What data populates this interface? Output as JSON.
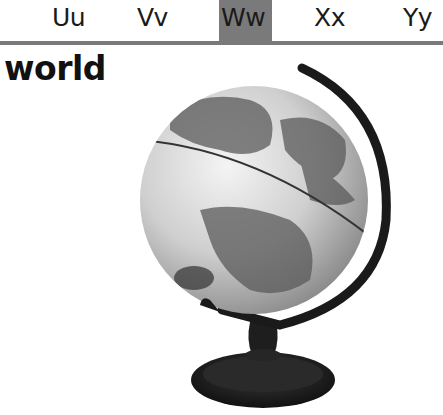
{
  "alphabet_strip": {
    "letters": [
      {
        "label": "Uu",
        "x": 52
      },
      {
        "label": "Vv",
        "x": 137
      },
      {
        "label": "Ww",
        "x": 221,
        "highlighted": true
      },
      {
        "label": "Xx",
        "x": 314
      },
      {
        "label": "Yy",
        "x": 403
      }
    ],
    "highlight_color": "#7a7a7a",
    "rule_color": "#7a7a7a"
  },
  "word": "world",
  "image": {
    "subject": "globe-on-stand",
    "alt": "world globe"
  }
}
